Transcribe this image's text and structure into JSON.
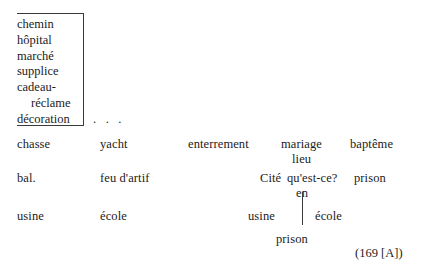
{
  "document": {
    "type": "scanned-manuscript-excerpt",
    "language": "fr"
  },
  "list_box": {
    "name": "bracketed-word-list",
    "entries": [
      {
        "text": "chemin",
        "indented": false
      },
      {
        "text": "hôpital",
        "indented": false
      },
      {
        "text": "marché",
        "indented": false
      },
      {
        "text": "supplice",
        "indented": false
      },
      {
        "text": "cadeau-",
        "indented": false
      },
      {
        "text": "réclame",
        "indented": true
      },
      {
        "text": "décoration",
        "indented": false
      }
    ]
  },
  "ellipsis": ". . .",
  "rows": [
    {
      "name": "row-chasse",
      "words": [
        {
          "text": "chasse",
          "x": 17,
          "y": 137
        },
        {
          "text": "yacht",
          "x": 100,
          "y": 137
        },
        {
          "text": "enterrement",
          "x": 188,
          "y": 137
        },
        {
          "text": "mariage",
          "x": 281,
          "y": 137
        },
        {
          "text": "baptême",
          "x": 350,
          "y": 137
        },
        {
          "text": "lieu",
          "x": 292,
          "y": 152
        }
      ]
    },
    {
      "name": "row-bal",
      "words": [
        {
          "text": "bal.",
          "x": 17,
          "y": 171
        },
        {
          "text": "feu d'artif",
          "x": 100,
          "y": 171
        },
        {
          "text": "Cité",
          "x": 260,
          "y": 171
        },
        {
          "text": "qu'est-ce?",
          "x": 287,
          "y": 171
        },
        {
          "text": "prison",
          "x": 354,
          "y": 171
        },
        {
          "text": "en",
          "x": 296,
          "y": 186
        }
      ]
    },
    {
      "name": "row-usine",
      "words": [
        {
          "text": "usine",
          "x": 17,
          "y": 209
        },
        {
          "text": "école",
          "x": 100,
          "y": 209
        },
        {
          "text": "usine",
          "x": 248,
          "y": 209
        },
        {
          "text": "école",
          "x": 315,
          "y": 209
        },
        {
          "text": "prison",
          "x": 276,
          "y": 232
        }
      ]
    }
  ],
  "connector": {
    "name": "vertical-rule-en-prison"
  },
  "citation": "(169 [A])",
  "colors": {
    "ink": "#1b1b1b",
    "rule": "#3a3a3a",
    "page": "#ffffff"
  }
}
